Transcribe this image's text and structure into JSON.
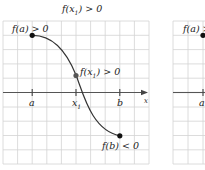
{
  "panels": [
    {
      "id": "left",
      "title": {
        "f": "f",
        "open": "(",
        "x": "x",
        "sub": "1",
        "close": ")",
        "rel": " > 0"
      },
      "labels": {
        "fa": {
          "text": "f(a)",
          "rel": " > 0"
        },
        "fx1": {
          "f": "f",
          "open": "(",
          "x": "x",
          "sub": "1",
          "close": ")",
          "rel": " > 0"
        },
        "fb": {
          "text": "f(b)",
          "rel": " < 0"
        }
      },
      "axis": {
        "label": "x",
        "ticks": [
          {
            "label": "a"
          },
          {
            "label": "x",
            "sub": "1"
          },
          {
            "label": "b"
          }
        ]
      }
    },
    {
      "id": "right-partial",
      "labels": {
        "fa": {
          "text": "f(a)",
          "rel": " >"
        }
      },
      "axis": {
        "ticks": [
          {
            "label": "a"
          }
        ]
      }
    }
  ],
  "colors": {
    "grid": "#d0d0d0",
    "axis": "#555555",
    "curve": "#333333",
    "point": "#111111"
  }
}
